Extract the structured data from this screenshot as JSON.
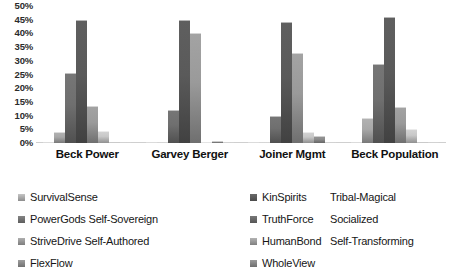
{
  "chart_data": {
    "type": "bar",
    "title": "",
    "xlabel": "",
    "ylabel": "",
    "ylim": [
      0,
      50
    ],
    "grid": false,
    "legend_position": "bottom",
    "categories": [
      "Beck Power",
      "Garvey Berger",
      "Joiner Mgmt",
      "Beck Population"
    ],
    "ytick_labels": [
      "50%",
      "45%",
      "40%",
      "35%",
      "30%",
      "25%",
      "20%",
      "15%",
      "10%",
      "5%",
      "0%"
    ],
    "ytick_values": [
      50,
      45,
      40,
      35,
      30,
      25,
      20,
      15,
      10,
      5,
      0
    ],
    "series": [
      {
        "name": "SurvivalSense",
        "color": "#b4b4b4",
        "values": [
          0.4,
          0.0,
          0.0,
          0.5
        ]
      },
      {
        "name": "KinSpirits",
        "alt_name": "Tribal-Magical",
        "color": "#a8a8a8",
        "values": [
          4.0,
          0.0,
          0.0,
          9.0
        ]
      },
      {
        "name": "PowerGods Self-Sovereign",
        "color": "#6f6f6f",
        "values": [
          25.5,
          12.0,
          10.0,
          29.0
        ]
      },
      {
        "name": "TruthForce",
        "alt_name": "Socialized",
        "color": "#5a5a5a",
        "values": [
          45.0,
          45.0,
          44.0,
          46.0
        ]
      },
      {
        "name": "StriveDrive Self-Authored",
        "color": "#9a9a9a",
        "values": [
          13.5,
          40.0,
          33.0,
          13.0
        ]
      },
      {
        "name": "HumanBond",
        "alt_name": "Self-Transforming",
        "color": "#c8c8c8",
        "values": [
          4.5,
          0.0,
          4.0,
          5.0
        ]
      },
      {
        "name": "FlexFlow",
        "color": "#8d8d8d",
        "values": [
          0.5,
          0.6,
          2.5,
          0.5
        ]
      },
      {
        "name": "WholeView",
        "color": "#9f9f9f",
        "values": [
          0.0,
          0.0,
          0.5,
          0.4
        ]
      }
    ]
  },
  "legend": {
    "columns": [
      {
        "items": [
          {
            "label": "SurvivalSense",
            "swatch": "#b0b0b0"
          },
          {
            "label": "PowerGods Self-Sovereign",
            "swatch": "#767676"
          },
          {
            "label": "StriveDrive Self-Authored",
            "swatch": "#9c9c9c"
          },
          {
            "label": "FlexFlow",
            "swatch": "#8d8d8d"
          }
        ]
      },
      {
        "items": [
          {
            "label": "KinSpirits",
            "swatch": "#5e5e5e"
          },
          {
            "label": "TruthForce",
            "swatch": "#6b6b6b"
          },
          {
            "label": "HumanBond",
            "swatch": "#a0a0a0"
          },
          {
            "label": "WholeView",
            "swatch": "#8a8a8a"
          }
        ]
      },
      {
        "items": [
          {
            "label": "Tribal-Magical",
            "swatch": null
          },
          {
            "label": "Socialized",
            "swatch": null
          },
          {
            "label": "Self-Transforming",
            "swatch": null
          }
        ]
      }
    ]
  },
  "title_strip": ""
}
